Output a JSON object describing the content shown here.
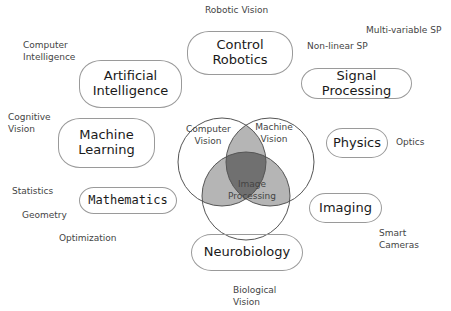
{
  "main_topics": {
    "control_robotics": "Control\nRobotics",
    "control": "Control",
    "robotics": "Robotics",
    "ai1": "Artificial",
    "ai2": "Intelligence",
    "signal_processing": "Signal Processing",
    "ml1": "Machine",
    "ml2": "Learning",
    "physics": "Physics",
    "mathematics": "Mathematics",
    "imaging": "Imaging",
    "neurobiology": "Neurobiology"
  },
  "venn": {
    "cv1": "Computer",
    "cv2": "Vision",
    "mv1": "Machine",
    "mv2": "Vision",
    "ip1": "Image",
    "ip2": "Processing"
  },
  "subtopics": {
    "robotic_vision": "Robotic Vision",
    "multi_variable_sp": "Multi-variable SP",
    "non_linear_sp": "Non-linear SP",
    "computer_intelligence_1": "Computer",
    "computer_intelligence_2": "Intelligence",
    "cognitive_vision_1": "Cognitive",
    "cognitive_vision_2": "Vision",
    "optics": "Optics",
    "statistics": "Statistics",
    "geometry": "Geometry",
    "optimization": "Optimization",
    "smart_cameras_1": "Smart",
    "smart_cameras_2": "Cameras",
    "biological_vision_1": "Biological",
    "biological_vision_2": "Vision"
  }
}
